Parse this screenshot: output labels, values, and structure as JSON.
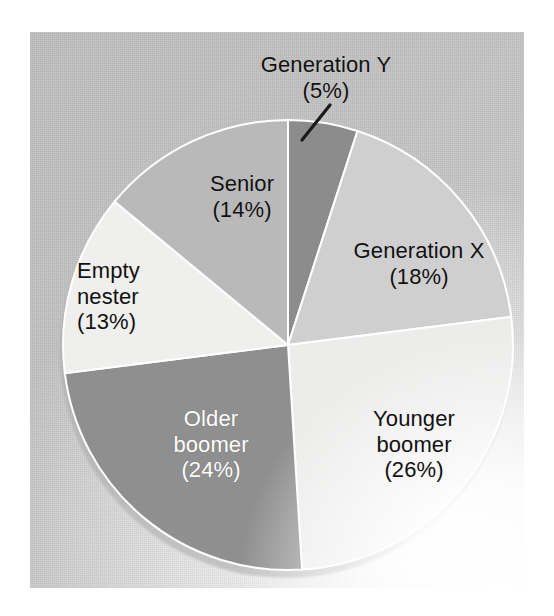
{
  "chart_data": {
    "type": "pie",
    "title": "",
    "subtitle": "",
    "xlabel": "",
    "ylabel": "",
    "legend_position": "none",
    "grid": false,
    "units": "percent",
    "total": 100,
    "start_angle_deg": 0,
    "direction": "clockwise",
    "categories": [
      "Generation Y",
      "Generation X",
      "Younger boomer",
      "Older boomer",
      "Empty nester",
      "Senior"
    ],
    "values": [
      5,
      18,
      26,
      24,
      13,
      14
    ],
    "slices": [
      {
        "id": "generation-y",
        "label": "Generation Y",
        "value": 5,
        "value_text": "(5%)",
        "color": "#8c8c8c",
        "text_color": "#111111",
        "label_placement": "outside",
        "leader_line": true,
        "label_lines": [
          "Generation Y",
          "(5%)"
        ]
      },
      {
        "id": "generation-x",
        "label": "Generation X",
        "value": 18,
        "value_text": "(18%)",
        "color": "#cfcfcf",
        "text_color": "#111111",
        "label_placement": "inside",
        "leader_line": false,
        "label_lines": [
          "Generation X",
          "(18%)"
        ]
      },
      {
        "id": "younger-boomer",
        "label": "Younger boomer",
        "value": 26,
        "value_text": "(26%)",
        "color": "#ececeb",
        "text_color": "#111111",
        "label_placement": "inside",
        "leader_line": false,
        "label_lines": [
          "Younger",
          "boomer",
          "(26%)"
        ]
      },
      {
        "id": "older-boomer",
        "label": "Older boomer",
        "value": 24,
        "value_text": "(24%)",
        "color": "#8f8f8f",
        "text_color": "#ffffff",
        "label_placement": "inside",
        "leader_line": false,
        "label_lines": [
          "Older",
          "boomer",
          "(24%)"
        ]
      },
      {
        "id": "empty-nester",
        "label": "Empty nester",
        "value": 13,
        "value_text": "(13%)",
        "color": "#efefee",
        "text_color": "#111111",
        "label_placement": "inside",
        "leader_line": false,
        "label_lines": [
          "Empty",
          "nester",
          "(13%)"
        ]
      },
      {
        "id": "senior",
        "label": "Senior",
        "value": 14,
        "value_text": "(14%)",
        "color": "#b9b9b9",
        "text_color": "#111111",
        "label_placement": "inside",
        "leader_line": false,
        "label_lines": [
          "Senior",
          "(14%)"
        ]
      }
    ],
    "colors": [
      "#8c8c8c",
      "#cfcfcf",
      "#ececeb",
      "#8f8f8f",
      "#efefee",
      "#b9b9b9"
    ],
    "background_color": "#c8c8c8",
    "page_color": "#ffffff"
  },
  "labels": {
    "generation_y": {
      "line1": "Generation Y",
      "line2": "(5%)"
    },
    "generation_x": {
      "line1": "Generation X",
      "line2": "(18%)"
    },
    "younger_boomer": {
      "line1": "Younger",
      "line2": "boomer",
      "line3": "(26%)"
    },
    "older_boomer": {
      "line1": "Older",
      "line2": "boomer",
      "line3": "(24%)"
    },
    "empty_nester": {
      "line1": "Empty",
      "line2": "nester",
      "line3": "(13%)"
    },
    "senior": {
      "line1": "Senior",
      "line2": "(14%)"
    }
  }
}
